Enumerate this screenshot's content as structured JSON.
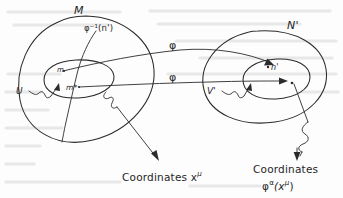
{
  "figure": {
    "kind": "hand-drawn mathematical diagram",
    "ink_color": "#2b2b2b",
    "background_color": "#fdfdfd",
    "ghost_color": "#d8d8d8"
  },
  "labels": {
    "manifold_left": "M",
    "manifold_right": "N'",
    "preimage": "φ⁻¹(n')",
    "map_upper": "φ",
    "map_lower": "φ",
    "point_m": "m",
    "point_m_star": "m*",
    "point_n_prime": "n'",
    "neighbourhood_left": "U",
    "neighbourhood_right": "V'",
    "coords_left": "Coordinates x",
    "coords_left_sup": "μ",
    "coords_right_line1": "Coordinates",
    "coords_right_phi": "φ",
    "coords_right_phi_sup": "α",
    "coords_right_arg_open": "(x",
    "coords_right_arg_sup": "μ",
    "coords_right_arg_close": ")"
  },
  "shapes": {
    "outer_left_oval": "large ellipse labelled M",
    "inner_left_oval": "small ellipse labelled U",
    "outer_right_oval": "large ellipse labelled N prime",
    "inner_right_oval": "small ellipse labelled V prime",
    "curve_through_left": "curve passing through U representing phi inverse of n prime",
    "arrow_upper": "arrow from m to n prime labelled phi",
    "arrow_lower": "arrow from m star into V prime labelled phi",
    "squiggle_U": "squiggly pointer from U to inner left oval",
    "squiggle_V": "squiggly pointer from V prime to inner right oval",
    "leader_left": "straight leader arrow from inner left oval to Coordinates x mu",
    "leader_right": "squiggly leader arrow from point in V prime to Coordinates phi alpha"
  }
}
